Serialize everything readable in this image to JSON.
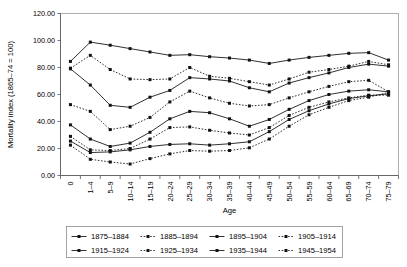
{
  "axes": {
    "ylabel": "Mortality index (1865–74 = 100)",
    "xlabel": "Age",
    "yticks": [
      "0.00",
      "20.00",
      "40.00",
      "60.00",
      "80.00",
      "100.00",
      "120.00"
    ]
  },
  "legend": {
    "items": [
      {
        "label": "1875–1884",
        "style": "solid"
      },
      {
        "label": "1885–1894",
        "style": "dashed"
      },
      {
        "label": "1895–1904",
        "style": "solid"
      },
      {
        "label": "1905–1914",
        "style": "dashed"
      },
      {
        "label": "1915–1924",
        "style": "solid"
      },
      {
        "label": "1925–1934",
        "style": "dashed"
      },
      {
        "label": "1935–1944",
        "style": "solid"
      },
      {
        "label": "1945–1954",
        "style": "dashed"
      }
    ]
  },
  "chart_data": {
    "type": "line",
    "title": "",
    "xlabel": "Age",
    "ylabel": "Mortality index (1865–74 = 100)",
    "ylim": [
      0,
      120
    ],
    "ytick_step": 20,
    "grid": false,
    "legend_position": "bottom",
    "categories": [
      "0",
      "1–4",
      "5–9",
      "10–14",
      "15–19",
      "20–24",
      "25–29",
      "30–34",
      "35–39",
      "40–44",
      "45–49",
      "50–54",
      "55–59",
      "60–64",
      "65–69",
      "70–74",
      "75–79"
    ],
    "series": [
      {
        "name": "1875–1884",
        "style": "solid",
        "values": [
          84.5,
          98.8,
          96.5,
          94.0,
          91.5,
          89.0,
          89.5,
          88.0,
          87.0,
          85.5,
          83.0,
          85.5,
          87.5,
          89.0,
          90.5,
          91.0,
          85.5
        ]
      },
      {
        "name": "1885–1894",
        "style": "dashed",
        "values": [
          79.5,
          89.0,
          78.5,
          71.5,
          71.0,
          71.5,
          80.0,
          73.5,
          72.0,
          69.5,
          67.0,
          71.5,
          76.5,
          78.5,
          81.0,
          84.5,
          82.0
        ]
      },
      {
        "name": "1895–1904",
        "style": "solid",
        "values": [
          79.0,
          67.0,
          52.0,
          50.5,
          58.0,
          63.0,
          72.5,
          71.5,
          70.0,
          65.0,
          62.0,
          68.5,
          72.5,
          76.0,
          80.0,
          82.5,
          81.0
        ]
      },
      {
        "name": "1905–1914",
        "style": "dashed",
        "values": [
          52.5,
          47.5,
          34.0,
          36.5,
          43.0,
          54.5,
          62.5,
          57.5,
          53.5,
          51.5,
          52.5,
          57.5,
          62.0,
          66.0,
          69.5,
          70.5,
          62.0
        ]
      },
      {
        "name": "1915–1924",
        "style": "solid",
        "values": [
          37.5,
          27.0,
          21.5,
          24.0,
          32.0,
          42.0,
          47.5,
          46.5,
          42.0,
          36.5,
          41.5,
          49.0,
          55.5,
          60.0,
          62.5,
          63.5,
          62.0
        ]
      },
      {
        "name": "1925–1934",
        "style": "dashed",
        "values": [
          29.0,
          19.0,
          18.5,
          20.0,
          27.0,
          35.5,
          36.0,
          33.5,
          31.5,
          30.0,
          35.5,
          44.5,
          50.5,
          54.5,
          57.5,
          59.5,
          59.5
        ]
      },
      {
        "name": "1935–1944",
        "style": "solid",
        "values": [
          25.5,
          17.0,
          17.5,
          19.0,
          21.5,
          23.0,
          23.5,
          22.5,
          23.5,
          25.0,
          32.5,
          41.5,
          48.0,
          53.0,
          57.0,
          59.0,
          60.5
        ]
      },
      {
        "name": "1945–1954",
        "style": "dashed",
        "values": [
          22.5,
          12.0,
          10.0,
          8.5,
          12.5,
          16.0,
          18.5,
          18.0,
          18.5,
          20.5,
          27.0,
          36.5,
          45.0,
          50.5,
          55.5,
          58.0,
          61.5
        ]
      }
    ]
  }
}
